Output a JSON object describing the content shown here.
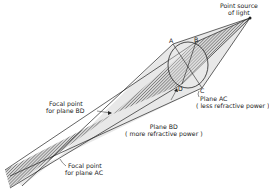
{
  "diagram": {
    "type": "optics-astigmatism",
    "labels": {
      "source_line1": "Point source",
      "source_line2": "of light",
      "point_a": "A",
      "point_b": "B",
      "point_c": "C",
      "point_d": "D",
      "plane_ac_line1": "Plane AC",
      "plane_ac_line2": "( less refractive power )",
      "plane_bd_line1": "Plane BD",
      "plane_bd_line2": "( more refractive power )",
      "focal_bd_line1": "Focal point",
      "focal_bd_line2": "for plane BD",
      "focal_ac_line1": "Focal point",
      "focal_ac_line2": "for plane AC"
    },
    "colors": {
      "stroke": "#222222",
      "light_cone": "#e6e6e6",
      "hatch": "#555555"
    }
  }
}
